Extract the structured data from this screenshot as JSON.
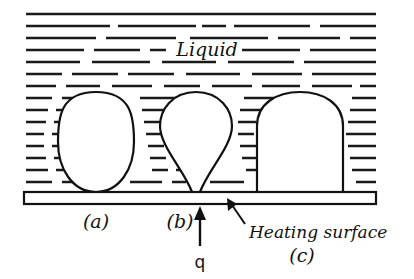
{
  "figure": {
    "background_color": "#ffffff",
    "ink_color": "#111111",
    "width": 414,
    "height": 279
  },
  "labels": {
    "liquid": "Liquid",
    "heating_surface": "Heating surface",
    "heat_flux": "q",
    "case_a": "(a)",
    "case_b": "(b)",
    "case_c": "(c)"
  },
  "bubbles": [
    {
      "id": "a",
      "label": "(a)",
      "shape": "ellipsoidal",
      "description": "Tall rounded bubble with narrow contact at the surface",
      "center_x": 96,
      "base_y": 192,
      "top_y": 92,
      "width": 70,
      "contact_width": 30
    },
    {
      "id": "b",
      "label": "(b)",
      "shape": "teardrop",
      "description": "Pear shaped bubble narrowing to a point at the surface",
      "center_x": 196,
      "base_y": 192,
      "top_y": 92,
      "width": 70,
      "contact_width": 12
    },
    {
      "id": "c",
      "label": "(c)",
      "shape": "dome",
      "description": "Flattened dome with vertical sides and a wide flat base",
      "center_x": 300,
      "base_y": 192,
      "top_y": 92,
      "width": 86,
      "contact_width": 86
    }
  ],
  "heating_surface": {
    "x": 24,
    "y": 192,
    "width": 352,
    "height": 12
  },
  "heat_flux_arrow": {
    "x": 200,
    "from_y": 245,
    "to_y": 209,
    "direction": "up"
  },
  "leader": {
    "text_anchor_x": 243,
    "text_anchor_y": 226,
    "tip_x": 228,
    "tip_y": 200
  },
  "liquid_hatch": {
    "description": "Horizontal dashed line pattern representing liquid",
    "rows": 14,
    "x_start": 24,
    "x_end": 378,
    "y_start": 12,
    "y_end": 190
  },
  "icons": {
    "up_arrow": "heat-flux-arrow",
    "leader_arrow": "leader-arrow"
  }
}
